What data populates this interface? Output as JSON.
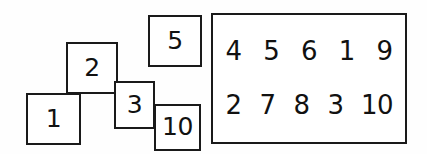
{
  "diagram": {
    "background_color": "#fefefe",
    "stroke_color": "#1a1a1a",
    "text_color": "#111111",
    "tiles": [
      {
        "label": "1",
        "x": 26,
        "y": 93,
        "w": 55,
        "h": 52,
        "z": 1
      },
      {
        "label": "2",
        "x": 66,
        "y": 42,
        "w": 52,
        "h": 52,
        "z": 2
      },
      {
        "label": "3",
        "x": 114,
        "y": 81,
        "w": 41,
        "h": 48,
        "z": 3
      },
      {
        "label": "10",
        "x": 154,
        "y": 104,
        "w": 47,
        "h": 47,
        "z": 4
      },
      {
        "label": "5",
        "x": 148,
        "y": 15,
        "w": 54,
        "h": 52,
        "z": 5
      }
    ],
    "group_box": {
      "x": 211,
      "y": 13,
      "w": 196,
      "h": 131,
      "rows": [
        {
          "name": "top-row",
          "cells": [
            "4",
            "5",
            "6",
            "1",
            "9"
          ]
        },
        {
          "name": "bottom-row",
          "cells": [
            "2",
            "7",
            "8",
            "3",
            "10"
          ]
        }
      ]
    }
  }
}
